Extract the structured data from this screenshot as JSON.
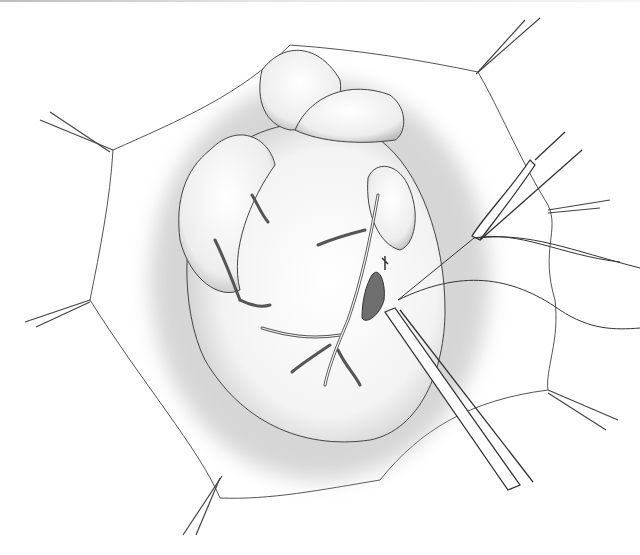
{
  "figure": {
    "style": "grayscale medical line illustration",
    "colors": {
      "background": "#ffffff",
      "line": "#3a3a3a",
      "shade": "#9a9a9a",
      "incision": "#6e6e6e"
    },
    "elements": {
      "pericardial_sutures": 7,
      "instruments": [
        "forceps-upper",
        "forceps-lower"
      ],
      "suture_threads": 3
    }
  }
}
